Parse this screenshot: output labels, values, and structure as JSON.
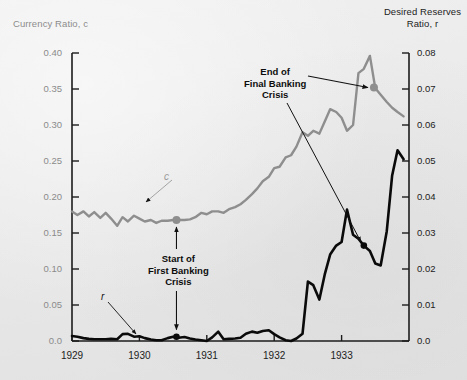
{
  "axes": {
    "left": {
      "title": "Currency Ratio, c",
      "ticks": [
        "0.40",
        "0.35",
        "0.30",
        "0.25",
        "0.20",
        "0.15",
        "0.10",
        "0.05",
        "0.0"
      ],
      "min": 0.0,
      "max": 0.4,
      "step": 0.05,
      "color": "#8b8b8b"
    },
    "right": {
      "title_line1": "Desired Reserves",
      "title_line2": "Ratio, r",
      "ticks": [
        "0.08",
        "0.07",
        "0.06",
        "0.05",
        "0.04",
        "0.03",
        "0.02",
        "0.01",
        "0.0"
      ],
      "min": 0.0,
      "max": 0.08,
      "step": 0.01,
      "color": "#1c1c1c"
    },
    "x": {
      "ticks": [
        "1929",
        "1930",
        "1931",
        "1932",
        "1933"
      ],
      "min": 1929.0,
      "max": 1934.0
    }
  },
  "series_keys": {
    "c": "c",
    "r": "r"
  },
  "annotations": {
    "end_crisis": "End of\nFinal Banking\nCrisis",
    "end_crisis_line1": "End of",
    "end_crisis_line2": "Final Banking",
    "end_crisis_line3": "Crisis",
    "start_crisis_line1": "Start of",
    "start_crisis_line2": "First Banking",
    "start_crisis_line3": "Crisis"
  },
  "colors": {
    "currency_ratio": "#8e8e8e",
    "reserves_ratio": "#0a0a0a",
    "background": "#e9e9e9",
    "axis": "#1c1c1c"
  },
  "chart_data": {
    "type": "line",
    "title": "",
    "xlabel": "",
    "ylabel": "Currency Ratio, c",
    "y2label": "Desired Reserves Ratio, r",
    "xlim": [
      1929.0,
      1934.0
    ],
    "ylim": [
      0.0,
      0.4
    ],
    "y2lim": [
      0.0,
      0.08
    ],
    "grid": false,
    "legend": "inline-labels",
    "xticks": [
      1929,
      1930,
      1931,
      1932,
      1933
    ],
    "yticks": [
      0.0,
      0.05,
      0.1,
      0.15,
      0.2,
      0.25,
      0.3,
      0.35,
      0.4
    ],
    "y2ticks": [
      0.0,
      0.01,
      0.02,
      0.03,
      0.04,
      0.05,
      0.06,
      0.07,
      0.08
    ],
    "series": [
      {
        "name": "c",
        "label": "Currency Ratio, c",
        "axis": "left",
        "color": "#8e8e8e",
        "x": [
          1929.0,
          1929.08,
          1929.17,
          1929.25,
          1929.33,
          1929.42,
          1929.5,
          1929.58,
          1929.67,
          1929.75,
          1929.83,
          1929.92,
          1930.0,
          1930.08,
          1930.17,
          1930.25,
          1930.33,
          1930.42,
          1930.5,
          1930.58,
          1930.67,
          1930.75,
          1930.83,
          1930.92,
          1931.0,
          1931.08,
          1931.17,
          1931.25,
          1931.33,
          1931.42,
          1931.5,
          1931.58,
          1931.67,
          1931.75,
          1931.83,
          1931.92,
          1932.0,
          1932.08,
          1932.17,
          1932.25,
          1932.33,
          1932.42,
          1932.5,
          1932.58,
          1932.67,
          1932.75,
          1932.83,
          1932.92,
          1933.0,
          1933.08,
          1933.17,
          1933.25,
          1933.33,
          1933.42,
          1933.5,
          1933.58,
          1933.67,
          1933.75,
          1933.83,
          1933.92
        ],
        "values": [
          0.18,
          0.175,
          0.18,
          0.173,
          0.179,
          0.171,
          0.178,
          0.17,
          0.16,
          0.172,
          0.166,
          0.174,
          0.17,
          0.166,
          0.168,
          0.164,
          0.167,
          0.167,
          0.168,
          0.168,
          0.168,
          0.169,
          0.172,
          0.178,
          0.176,
          0.18,
          0.18,
          0.178,
          0.183,
          0.186,
          0.19,
          0.196,
          0.204,
          0.212,
          0.222,
          0.228,
          0.24,
          0.242,
          0.255,
          0.258,
          0.27,
          0.29,
          0.285,
          0.292,
          0.288,
          0.305,
          0.322,
          0.318,
          0.31,
          0.292,
          0.3,
          0.372,
          0.378,
          0.396,
          0.351,
          0.342,
          0.332,
          0.324,
          0.318,
          0.312
        ]
      },
      {
        "name": "r",
        "label": "Desired Reserves Ratio, r",
        "axis": "right",
        "color": "#0a0a0a",
        "x": [
          1929.0,
          1929.08,
          1929.17,
          1929.25,
          1929.33,
          1929.42,
          1929.5,
          1929.58,
          1929.67,
          1929.75,
          1929.83,
          1929.92,
          1930.0,
          1930.08,
          1930.17,
          1930.25,
          1930.33,
          1930.42,
          1930.5,
          1930.58,
          1930.67,
          1930.75,
          1930.83,
          1930.92,
          1931.0,
          1931.08,
          1931.17,
          1931.25,
          1931.33,
          1931.42,
          1931.5,
          1931.58,
          1931.67,
          1931.75,
          1931.83,
          1931.92,
          1932.0,
          1932.08,
          1932.17,
          1932.25,
          1932.33,
          1932.42,
          1932.5,
          1932.58,
          1932.67,
          1932.75,
          1932.83,
          1932.92,
          1933.0,
          1933.08,
          1933.17,
          1933.25,
          1933.33,
          1933.42,
          1933.5,
          1933.58,
          1933.67,
          1933.75,
          1933.83,
          1933.92
        ],
        "values": [
          0.0014,
          0.0012,
          0.0008,
          0.0006,
          0.0005,
          0.0005,
          0.0005,
          0.0006,
          0.0005,
          0.0019,
          0.002,
          0.0012,
          0.0013,
          0.0008,
          0.0004,
          0.0002,
          0.0002,
          0.0008,
          0.0012,
          0.0009,
          0.0011,
          0.0007,
          0.0004,
          0.0002,
          0.0,
          0.001,
          0.0026,
          0.0005,
          0.0006,
          0.0007,
          0.0009,
          0.002,
          0.0026,
          0.0023,
          0.0028,
          0.003,
          0.0019,
          0.001,
          0.0002,
          0.0,
          0.0007,
          0.002,
          0.0165,
          0.0155,
          0.0115,
          0.0185,
          0.024,
          0.0265,
          0.0275,
          0.0365,
          0.0295,
          0.0284,
          0.0265,
          0.025,
          0.0215,
          0.021,
          0.0305,
          0.046,
          0.053,
          0.0505
        ]
      }
    ],
    "markers": [
      {
        "label": "Start of First Banking Crisis",
        "series": "c",
        "x": 1930.55,
        "value": 0.168,
        "color": "#8e8e8e"
      },
      {
        "label": "Start of First Banking Crisis",
        "series": "r",
        "x": 1930.55,
        "value": 0.0012,
        "color": "#0a0a0a"
      },
      {
        "label": "End of Final Banking Crisis",
        "series": "c",
        "x": 1933.48,
        "value": 0.352,
        "color": "#8e8e8e"
      },
      {
        "label": "End of Final Banking Crisis",
        "series": "r",
        "x": 1933.33,
        "value": 0.0265,
        "color": "#0a0a0a"
      }
    ]
  }
}
